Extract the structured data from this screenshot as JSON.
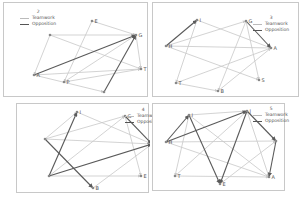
{
  "legend": {
    "teamwork": "Teamwork",
    "opposition": "Opposition"
  },
  "colors": {
    "teamwork": "#c8c8c8",
    "opposition": "#5a5a5a",
    "border": "#c8c8c8"
  },
  "panels": [
    {
      "title": "2",
      "nodes": [
        {
          "id": "A",
          "x": 30,
          "y": 72,
          "label": "A"
        },
        {
          "id": "E",
          "x": 88,
          "y": 18,
          "label": "E"
        },
        {
          "id": "G",
          "x": 132,
          "y": 32,
          "label": "G"
        },
        {
          "id": "H",
          "x": 46,
          "y": 32,
          "label": ""
        },
        {
          "id": "T",
          "x": 137,
          "y": 66,
          "label": "T"
        },
        {
          "id": "P",
          "x": 60,
          "y": 79,
          "label": "P"
        },
        {
          "id": "B",
          "x": 100,
          "y": 89,
          "label": ""
        }
      ],
      "edges": [
        {
          "from": "A",
          "to": "G",
          "type": "opposition"
        },
        {
          "from": "B",
          "to": "G",
          "type": "opposition"
        },
        {
          "from": "H",
          "to": "G",
          "type": "teamwork"
        },
        {
          "from": "H",
          "to": "T",
          "type": "teamwork"
        },
        {
          "from": "E",
          "to": "G",
          "type": "teamwork"
        },
        {
          "from": "E",
          "to": "P",
          "type": "teamwork"
        },
        {
          "from": "A",
          "to": "T",
          "type": "teamwork"
        },
        {
          "from": "A",
          "to": "B",
          "type": "teamwork"
        },
        {
          "from": "P",
          "to": "G",
          "type": "teamwork"
        },
        {
          "from": "P",
          "to": "T",
          "type": "teamwork"
        },
        {
          "from": "G",
          "to": "T",
          "type": "teamwork"
        },
        {
          "from": "H",
          "to": "A",
          "type": "teamwork"
        }
      ]
    },
    {
      "title": "3",
      "nodes": [
        {
          "id": "H",
          "x": 13,
          "y": 43,
          "label": "H"
        },
        {
          "id": "I",
          "x": 44,
          "y": 17,
          "label": "I"
        },
        {
          "id": "G",
          "x": 93,
          "y": 18,
          "label": "G"
        },
        {
          "id": "A",
          "x": 118,
          "y": 45,
          "label": "A"
        },
        {
          "id": "S",
          "x": 106,
          "y": 77,
          "label": "S"
        },
        {
          "id": "T",
          "x": 23,
          "y": 80,
          "label": "T"
        },
        {
          "id": "B",
          "x": 65,
          "y": 88,
          "label": "B"
        }
      ],
      "edges": [
        {
          "from": "H",
          "to": "I",
          "type": "opposition"
        },
        {
          "from": "G",
          "to": "A",
          "type": "opposition"
        },
        {
          "from": "H",
          "to": "G",
          "type": "teamwork"
        },
        {
          "from": "H",
          "to": "A",
          "type": "teamwork"
        },
        {
          "from": "H",
          "to": "S",
          "type": "teamwork"
        },
        {
          "from": "I",
          "to": "A",
          "type": "teamwork"
        },
        {
          "from": "I",
          "to": "T",
          "type": "teamwork"
        },
        {
          "from": "G",
          "to": "S",
          "type": "teamwork"
        },
        {
          "from": "G",
          "to": "B",
          "type": "teamwork"
        },
        {
          "from": "T",
          "to": "A",
          "type": "teamwork"
        },
        {
          "from": "T",
          "to": "B",
          "type": "teamwork"
        },
        {
          "from": "B",
          "to": "A",
          "type": "teamwork"
        }
      ]
    },
    {
      "title": "4",
      "nodes": [
        {
          "id": "I",
          "x": 60,
          "y": 8,
          "label": "I"
        },
        {
          "id": "G",
          "x": 108,
          "y": 12,
          "label": "G"
        },
        {
          "id": "A",
          "x": 135,
          "y": 40,
          "label": "A"
        },
        {
          "id": "H",
          "x": 28,
          "y": 35,
          "label": ""
        },
        {
          "id": "D",
          "x": 32,
          "y": 72,
          "label": ""
        },
        {
          "id": "E",
          "x": 124,
          "y": 72,
          "label": "E"
        },
        {
          "id": "B",
          "x": 76,
          "y": 84,
          "label": "B"
        }
      ],
      "edges": [
        {
          "from": "D",
          "to": "I",
          "type": "opposition"
        },
        {
          "from": "D",
          "to": "A",
          "type": "opposition"
        },
        {
          "from": "H",
          "to": "B",
          "type": "opposition"
        },
        {
          "from": "G",
          "to": "A",
          "type": "opposition"
        },
        {
          "from": "I",
          "to": "A",
          "type": "teamwork"
        },
        {
          "from": "H",
          "to": "G",
          "type": "teamwork"
        },
        {
          "from": "H",
          "to": "A",
          "type": "teamwork"
        },
        {
          "from": "H",
          "to": "I",
          "type": "teamwork"
        },
        {
          "from": "D",
          "to": "G",
          "type": "teamwork"
        },
        {
          "from": "D",
          "to": "E",
          "type": "teamwork"
        },
        {
          "from": "G",
          "to": "E",
          "type": "teamwork"
        },
        {
          "from": "B",
          "to": "A",
          "type": "teamwork"
        }
      ]
    },
    {
      "title": "5",
      "nodes": [
        {
          "id": "I",
          "x": 36,
          "y": 11,
          "label": "I"
        },
        {
          "id": "J",
          "x": 94,
          "y": 7,
          "label": "J"
        },
        {
          "id": "H",
          "x": 13,
          "y": 38,
          "label": "H"
        },
        {
          "id": "K",
          "x": 123,
          "y": 37,
          "label": ""
        },
        {
          "id": "T",
          "x": 22,
          "y": 72,
          "label": "T"
        },
        {
          "id": "E",
          "x": 67,
          "y": 80,
          "label": "E"
        },
        {
          "id": "A",
          "x": 116,
          "y": 73,
          "label": "A"
        }
      ],
      "edges": [
        {
          "from": "H",
          "to": "I",
          "type": "opposition"
        },
        {
          "from": "H",
          "to": "J",
          "type": "opposition"
        },
        {
          "from": "I",
          "to": "E",
          "type": "opposition"
        },
        {
          "from": "J",
          "to": "E",
          "type": "opposition"
        },
        {
          "from": "J",
          "to": "K",
          "type": "opposition"
        },
        {
          "from": "K",
          "to": "A",
          "type": "opposition"
        },
        {
          "from": "I",
          "to": "J",
          "type": "teamwork"
        },
        {
          "from": "H",
          "to": "K",
          "type": "teamwork"
        },
        {
          "from": "I",
          "to": "A",
          "type": "teamwork"
        },
        {
          "from": "I",
          "to": "T",
          "type": "teamwork"
        },
        {
          "from": "T",
          "to": "A",
          "type": "teamwork"
        },
        {
          "from": "T",
          "to": "J",
          "type": "teamwork"
        },
        {
          "from": "E",
          "to": "K",
          "type": "teamwork"
        },
        {
          "from": "J",
          "to": "A",
          "type": "teamwork"
        },
        {
          "from": "H",
          "to": "A",
          "type": "teamwork"
        }
      ]
    }
  ]
}
